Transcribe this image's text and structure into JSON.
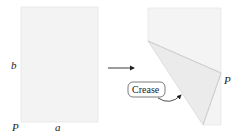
{
  "diagram": {
    "left_panel": {
      "label_side": "b",
      "label_bottom": "a",
      "label_corner": "P"
    },
    "arrow": {
      "direction": "right"
    },
    "right_panel": {
      "label_corner": "P",
      "callout": "Crease"
    },
    "colors": {
      "paper": "#f3f3f3",
      "paper_folded": "#ececec",
      "edge": "#d6d6d6",
      "ink": "#222222"
    }
  }
}
